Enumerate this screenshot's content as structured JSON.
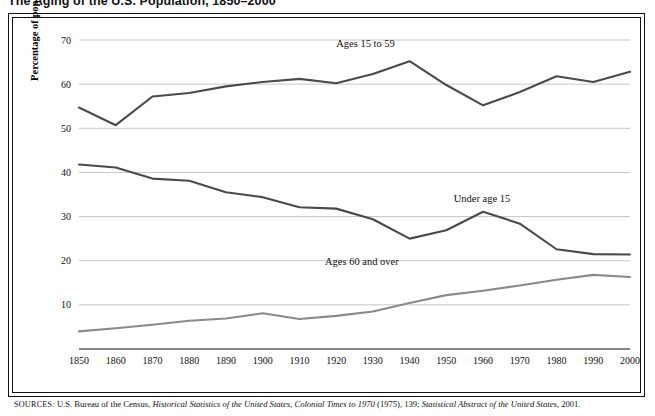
{
  "title": "The Aging of the U.S. Population, 1850–2000",
  "source": {
    "label": "SOURCES:",
    "text_1": "U.S. Bureau of the Census, ",
    "italic_1": "Historical Statistics of the United States, Colonial Times to 1970",
    "text_2": " (1975), 139; ",
    "italic_2": "Statistical Abstract of the United States,",
    "text_3": " 2001."
  },
  "chart_data": {
    "type": "line",
    "title": "The Aging of the U.S. Population, 1850–2000",
    "xlabel": "",
    "ylabel": "Percentage of population",
    "xlim": [
      1850,
      2000
    ],
    "ylim": [
      0,
      70
    ],
    "yticks": [
      0,
      10,
      20,
      30,
      40,
      50,
      60,
      70
    ],
    "grid": "horizontal",
    "legend": "inline-annotations",
    "categories": [
      1850,
      1860,
      1870,
      1880,
      1890,
      1900,
      1910,
      1920,
      1930,
      1940,
      1950,
      1960,
      1970,
      1980,
      1990,
      2000
    ],
    "series": [
      {
        "name": "Ages 15 to 59",
        "label": "Ages 15 to 59",
        "color": "#4a4a4a",
        "values": [
          54.7,
          50.7,
          57.2,
          58.0,
          59.5,
          60.5,
          61.2,
          60.2,
          62.3,
          65.2,
          59.8,
          55.2,
          58.2,
          61.8,
          60.5,
          62.8
        ]
      },
      {
        "name": "Under age 15",
        "label": "Under age 15",
        "color": "#4a4a4a",
        "values": [
          41.8,
          41.1,
          38.6,
          38.1,
          35.5,
          34.4,
          32.1,
          31.8,
          29.4,
          25.0,
          26.9,
          31.1,
          28.4,
          22.6,
          21.5,
          21.4
        ]
      },
      {
        "name": "Ages 60 and over",
        "label": "Ages 60 and over",
        "color": "#8a8a8a",
        "values": [
          4.0,
          4.7,
          5.5,
          6.4,
          6.9,
          8.1,
          6.8,
          7.5,
          8.5,
          10.4,
          12.2,
          13.2,
          14.4,
          15.7,
          16.8,
          16.3
        ]
      }
    ]
  }
}
